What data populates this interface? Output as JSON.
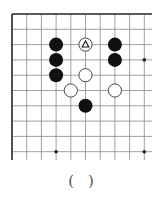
{
  "diagram": {
    "type": "go-board-fragment",
    "grid": {
      "cols": 10,
      "rows": 10,
      "x0": 12,
      "y0": 14,
      "dx": 14.7,
      "dy": 15.3,
      "open_right": true,
      "open_bottom": true,
      "line_color": "#888888",
      "border_color": "#333333"
    },
    "star_points": [
      {
        "col": 9,
        "row": 3
      },
      {
        "col": 3,
        "row": 9
      },
      {
        "col": 9,
        "row": 9
      }
    ],
    "stones": [
      {
        "color": "black",
        "col": 3,
        "row": 2
      },
      {
        "color": "black",
        "col": 3,
        "row": 3
      },
      {
        "color": "black",
        "col": 3,
        "row": 4
      },
      {
        "color": "black",
        "col": 7,
        "row": 2
      },
      {
        "color": "black",
        "col": 7,
        "row": 3
      },
      {
        "color": "black",
        "col": 5,
        "row": 6
      },
      {
        "color": "white",
        "col": 5,
        "row": 2,
        "marker": "triangle"
      },
      {
        "color": "white",
        "col": 5,
        "row": 4
      },
      {
        "color": "white",
        "col": 4,
        "row": 5
      },
      {
        "color": "white",
        "col": 7,
        "row": 5
      }
    ]
  },
  "caption": {
    "open": "(",
    "close": ")"
  }
}
